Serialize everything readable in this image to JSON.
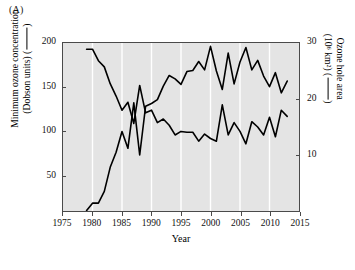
{
  "panel": {
    "label": "(A)"
  },
  "axes": {
    "x": {
      "title": "Year",
      "ticks": [
        1975,
        1980,
        1985,
        1990,
        1995,
        2000,
        2005,
        2010,
        2015
      ],
      "tick_labels": [
        "1975",
        "1980",
        "1985",
        "1990",
        "1995",
        "2000",
        "2005",
        "2010",
        "2015"
      ],
      "range": [
        1975,
        2015
      ]
    },
    "y_left": {
      "title_line1": "Minimum ozone concentration",
      "title_line2": "(Dobson units) (",
      "title_line2_end": ")",
      "ticks": [
        50,
        100,
        150,
        200
      ],
      "tick_labels": [
        "50",
        "100",
        "150",
        "200"
      ],
      "range": [
        10,
        200
      ],
      "units": "Dobson units"
    },
    "y_right": {
      "title_line1": "Ozone hole area",
      "title_line2": "(10⁶ km²) (",
      "title_line2_end": ")",
      "ticks": [
        10,
        20,
        30
      ],
      "tick_labels": [
        "10",
        "20",
        "30"
      ],
      "range": [
        0,
        30
      ],
      "units": "10⁶ km²"
    }
  },
  "style": {
    "plot_background": "#e4e4e4",
    "gridline_color": "#ffffff",
    "frame_color": "#4a4a4a",
    "line_color": "#000000",
    "page_background": "#ffffff"
  },
  "chart_data": {
    "type": "line",
    "title": "",
    "subtitle": "",
    "xlabel": "Year",
    "ylabel": "Minimum ozone concentration (Dobson units)",
    "ylabel_right": "Ozone hole area (10⁶ km²)",
    "xlim": [
      1975,
      2015
    ],
    "ylim": [
      10,
      200
    ],
    "ylim_right": [
      0,
      30
    ],
    "grid": true,
    "grid_axis": "x",
    "legend": "inline-in-axis-labels",
    "x": [
      1979,
      1980,
      1981,
      1982,
      1983,
      1984,
      1985,
      1986,
      1987,
      1988,
      1989,
      1990,
      1991,
      1992,
      1993,
      1994,
      1995,
      1996,
      1997,
      1998,
      1999,
      2000,
      2001,
      2002,
      2003,
      2004,
      2005,
      2006,
      2007,
      2008,
      2009,
      2010,
      2011,
      2012,
      2013
    ],
    "series": [
      {
        "name": "Minimum ozone concentration",
        "axis": "left",
        "units": "Dobson units",
        "values": [
          193,
          193,
          180,
          173,
          154,
          140,
          124,
          133,
          109,
          152,
          121,
          124,
          110,
          114,
          107,
          96,
          100,
          99,
          99,
          89,
          97,
          92,
          89,
          130,
          96,
          110,
          100,
          86,
          111,
          105,
          96,
          116,
          94,
          124,
          117
        ]
      },
      {
        "name": "Ozone hole area",
        "axis": "right",
        "units": "10⁶ km²",
        "values": [
          0.1,
          1.4,
          1.4,
          3.5,
          7.8,
          10.5,
          14.2,
          11.2,
          19.3,
          10.0,
          18.7,
          19.2,
          19.9,
          22.3,
          24.2,
          23.6,
          22.6,
          24.9,
          25.1,
          26.7,
          25.2,
          29.4,
          25.0,
          21.7,
          28.2,
          22.7,
          26.6,
          29.2,
          25.2,
          26.9,
          24.1,
          22.2,
          24.7,
          21.1,
          23.2
        ]
      }
    ]
  }
}
